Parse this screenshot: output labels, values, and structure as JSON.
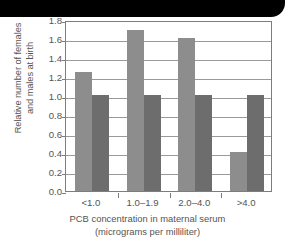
{
  "banner": {
    "label": ""
  },
  "chart_data": {
    "type": "bar",
    "title": "",
    "subtitle": "",
    "categories": [
      "<1.0",
      "1.0–1.9",
      "2.0–4.0",
      ">4.0"
    ],
    "series": [
      {
        "name": "females",
        "color": "#8d8d8d",
        "values": [
          1.25,
          1.69,
          1.61,
          0.41
        ]
      },
      {
        "name": "males",
        "color": "#6d6d6d",
        "values": [
          1.01,
          1.01,
          1.01,
          1.01
        ]
      }
    ],
    "xlabel": "PCB concentration in maternal serum (micrograms per milliliter)",
    "xlabel_lines": [
      "PCB concentration in maternal serum",
      "(micrograms per milliliter)"
    ],
    "ylabel": "Relative number of females and males at birth",
    "ylabel_lines": [
      "Relative number of females",
      "and males at birth"
    ],
    "ylim": [
      0.0,
      1.8
    ],
    "ytick_labels": [
      "1.8",
      "1.6",
      "1.4",
      "1.2",
      "1.0",
      "0.8",
      "0.6",
      "0.4",
      "0.2",
      "0.0"
    ],
    "ytick_values": [
      1.8,
      1.6,
      1.4,
      1.2,
      1.0,
      0.8,
      0.6,
      0.4,
      0.2,
      0.0
    ],
    "grid": true,
    "legend": "none",
    "axis_color": "#7d7d7d",
    "grid_color": "#9a9a9a",
    "text_color": "#555555",
    "plot_background": "#ffffff"
  }
}
